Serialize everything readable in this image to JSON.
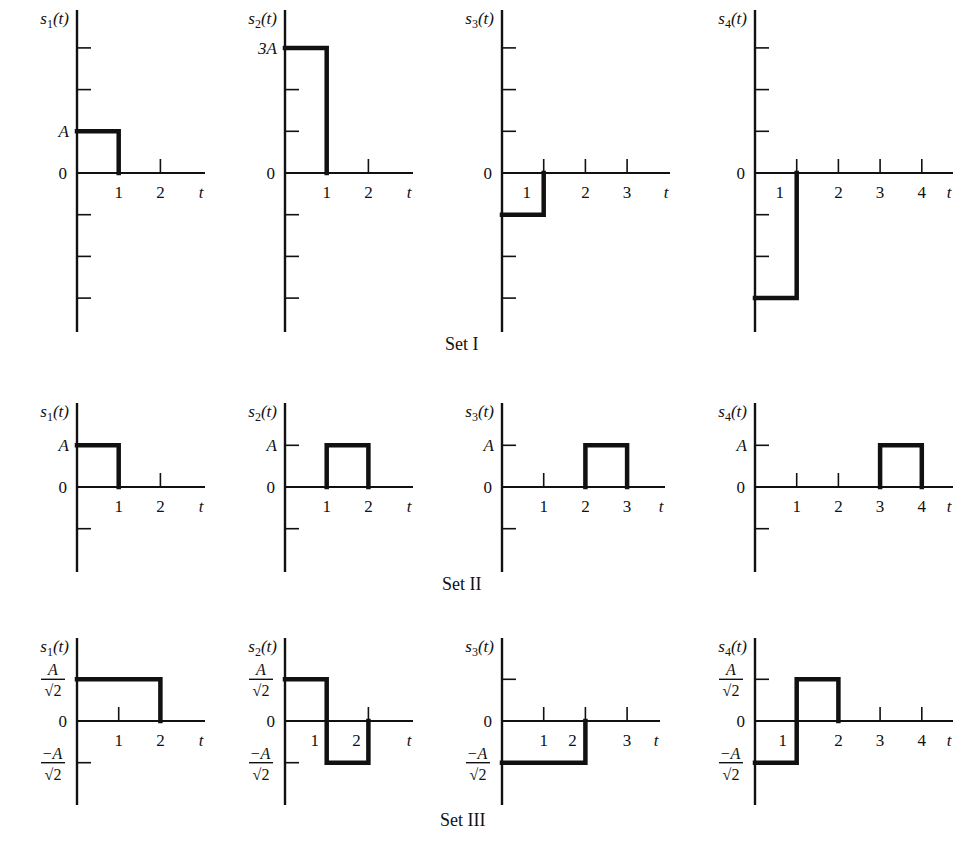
{
  "figure": {
    "ink_color": "#111111",
    "background": "#ffffff",
    "unit_px": 41.7,
    "sets": [
      {
        "label": "Set I",
        "label_pos": [
          445,
          350
        ],
        "axis_top": 10,
        "axis_bottom": 332,
        "zero_y": 173,
        "y_ticks_units": [
          3,
          2,
          1,
          -1,
          -2,
          -3
        ],
        "plots": [
          {
            "name": "s1(t)",
            "sub": "1",
            "axis_x": 77,
            "x_end": 205,
            "x_ticks": [
              1,
              2
            ],
            "x_tick_labels": [
              {
                "t": 1,
                "text": "1",
                "dx": 0
              },
              {
                "t": 2,
                "text": "2",
                "dx": 0
              }
            ],
            "y_labels": [
              {
                "v": 1,
                "text": "A"
              }
            ],
            "show_tick_marks": [
              false,
              true
            ],
            "segments": [
              [
                0,
                1
              ],
              [
                1,
                1
              ],
              [
                1,
                0
              ]
            ]
          },
          {
            "name": "s2(t)",
            "sub": "2",
            "axis_x": 285,
            "x_end": 413,
            "x_ticks": [
              1,
              2
            ],
            "x_tick_labels": [
              {
                "t": 1,
                "text": "1",
                "dx": 0
              },
              {
                "t": 2,
                "text": "2",
                "dx": 0
              }
            ],
            "y_labels": [
              {
                "v": 3,
                "text": "3A"
              }
            ],
            "show_tick_marks": [
              false,
              true
            ],
            "segments": [
              [
                0,
                3
              ],
              [
                1,
                3
              ],
              [
                1,
                0
              ]
            ]
          },
          {
            "name": "s3(t)",
            "sub": "3",
            "axis_x": 502,
            "x_end": 670,
            "x_ticks": [
              1,
              2,
              3
            ],
            "x_tick_labels": [
              {
                "t": 1,
                "text": "1",
                "dx": -17
              },
              {
                "t": 2,
                "text": "2",
                "dx": 0
              },
              {
                "t": 3,
                "text": "3",
                "dx": 0
              }
            ],
            "y_labels": [],
            "show_tick_marks": [
              true,
              true,
              true
            ],
            "segments": [
              [
                0,
                -1
              ],
              [
                1,
                -1
              ],
              [
                1,
                0
              ]
            ]
          },
          {
            "name": "s4(t)",
            "sub": "4",
            "axis_x": 755,
            "x_end": 953,
            "x_ticks": [
              1,
              2,
              3,
              4
            ],
            "x_tick_labels": [
              {
                "t": 1,
                "text": "1",
                "dx": -17
              },
              {
                "t": 2,
                "text": "2",
                "dx": 0
              },
              {
                "t": 3,
                "text": "3",
                "dx": 0
              },
              {
                "t": 4,
                "text": "4",
                "dx": 0
              }
            ],
            "y_labels": [],
            "show_tick_marks": [
              true,
              true,
              true,
              true
            ],
            "segments": [
              [
                0,
                -3
              ],
              [
                1,
                -3
              ],
              [
                1,
                0
              ]
            ]
          }
        ]
      },
      {
        "label": "Set II",
        "label_pos": [
          442,
          590
        ],
        "axis_top": 403,
        "axis_bottom": 572,
        "zero_y": 487,
        "y_ticks_units": [
          1,
          -1
        ],
        "plots": [
          {
            "name": "s1(t)",
            "sub": "1",
            "axis_x": 77,
            "x_end": 205,
            "x_ticks": [
              1,
              2
            ],
            "x_tick_labels": [
              {
                "t": 1,
                "text": "1",
                "dx": 0
              },
              {
                "t": 2,
                "text": "2",
                "dx": 0
              }
            ],
            "y_labels": [
              {
                "v": 1,
                "text": "A"
              }
            ],
            "show_tick_marks": [
              false,
              true
            ],
            "segments": [
              [
                0,
                1
              ],
              [
                1,
                1
              ],
              [
                1,
                0
              ]
            ]
          },
          {
            "name": "s2(t)",
            "sub": "2",
            "axis_x": 285,
            "x_end": 413,
            "x_ticks": [
              1,
              2
            ],
            "x_tick_labels": [
              {
                "t": 1,
                "text": "1",
                "dx": 0
              },
              {
                "t": 2,
                "text": "2",
                "dx": 0
              }
            ],
            "y_labels": [
              {
                "v": 1,
                "text": "A"
              }
            ],
            "show_tick_marks": [
              false,
              false
            ],
            "segments": [
              [
                1,
                0
              ],
              [
                1,
                1
              ],
              [
                2,
                1
              ],
              [
                2,
                0
              ]
            ]
          },
          {
            "name": "s3(t)",
            "sub": "3",
            "axis_x": 502,
            "x_end": 665,
            "x_ticks": [
              1,
              2,
              3
            ],
            "x_tick_labels": [
              {
                "t": 1,
                "text": "1",
                "dx": 0
              },
              {
                "t": 2,
                "text": "2",
                "dx": 0
              },
              {
                "t": 3,
                "text": "3",
                "dx": 0
              }
            ],
            "y_labels": [
              {
                "v": 1,
                "text": "A"
              }
            ],
            "show_tick_marks": [
              true,
              false,
              false
            ],
            "segments": [
              [
                2,
                0
              ],
              [
                2,
                1
              ],
              [
                3,
                1
              ],
              [
                3,
                0
              ]
            ]
          },
          {
            "name": "s4(t)",
            "sub": "4",
            "axis_x": 755,
            "x_end": 953,
            "x_ticks": [
              1,
              2,
              3,
              4
            ],
            "x_tick_labels": [
              {
                "t": 1,
                "text": "1",
                "dx": 0
              },
              {
                "t": 2,
                "text": "2",
                "dx": 0
              },
              {
                "t": 3,
                "text": "3",
                "dx": 0
              },
              {
                "t": 4,
                "text": "4",
                "dx": 0
              }
            ],
            "y_labels": [
              {
                "v": 1,
                "text": "A"
              }
            ],
            "show_tick_marks": [
              true,
              true,
              false,
              false
            ],
            "segments": [
              [
                3,
                0
              ],
              [
                3,
                1
              ],
              [
                4,
                1
              ],
              [
                4,
                0
              ]
            ]
          }
        ]
      },
      {
        "label": "Set III",
        "label_pos": [
          440,
          826
        ],
        "axis_top": 638,
        "axis_bottom": 805,
        "zero_y": 721,
        "y_ticks_units": [
          1,
          -1
        ],
        "plots": [
          {
            "name": "s1(t)",
            "sub": "1",
            "axis_x": 77,
            "x_end": 205,
            "x_ticks": [
              1,
              2
            ],
            "x_tick_labels": [
              {
                "t": 1,
                "text": "1",
                "dx": 0
              },
              {
                "t": 2,
                "text": "2",
                "dx": 0
              }
            ],
            "y_labels": [
              {
                "v": 1,
                "text": "A/√2"
              },
              {
                "v": -1,
                "text": "−A/√2"
              }
            ],
            "show_tick_marks": [
              true,
              false
            ],
            "segments": [
              [
                0,
                1
              ],
              [
                2,
                1
              ],
              [
                2,
                0
              ]
            ]
          },
          {
            "name": "s2(t)",
            "sub": "2",
            "axis_x": 285,
            "x_end": 413,
            "x_ticks": [
              1,
              2
            ],
            "x_tick_labels": [
              {
                "t": 1,
                "text": "1",
                "dx": -12
              },
              {
                "t": 2,
                "text": "2",
                "dx": -12
              }
            ],
            "y_labels": [
              {
                "v": 1,
                "text": "A/√2"
              },
              {
                "v": -1,
                "text": "−A/√2"
              }
            ],
            "show_tick_marks": [
              false,
              true
            ],
            "segments": [
              [
                0,
                1
              ],
              [
                1,
                1
              ],
              [
                1,
                -1
              ],
              [
                2,
                -1
              ],
              [
                2,
                0
              ]
            ]
          },
          {
            "name": "s3(t)",
            "sub": "3",
            "axis_x": 502,
            "x_end": 660,
            "x_ticks": [
              1,
              2,
              3
            ],
            "x_tick_labels": [
              {
                "t": 1,
                "text": "1",
                "dx": 0
              },
              {
                "t": 2,
                "text": "2",
                "dx": -13
              },
              {
                "t": 3,
                "text": "3",
                "dx": 0
              }
            ],
            "y_labels": [
              {
                "v": -1,
                "text": "−A/√2"
              }
            ],
            "show_tick_marks": [
              true,
              true,
              true
            ],
            "segments": [
              [
                0,
                -1
              ],
              [
                2,
                -1
              ],
              [
                2,
                0
              ]
            ]
          },
          {
            "name": "s4(t)",
            "sub": "4",
            "axis_x": 755,
            "x_end": 953,
            "x_ticks": [
              1,
              2,
              3,
              4
            ],
            "x_tick_labels": [
              {
                "t": 1,
                "text": "1",
                "dx": -14
              },
              {
                "t": 2,
                "text": "2",
                "dx": 0
              },
              {
                "t": 3,
                "text": "3",
                "dx": 0
              },
              {
                "t": 4,
                "text": "4",
                "dx": 0
              }
            ],
            "y_labels": [
              {
                "v": 1,
                "text": "A/√2"
              },
              {
                "v": -1,
                "text": "−A/√2"
              }
            ],
            "show_tick_marks": [
              false,
              false,
              true,
              true
            ],
            "segments": [
              [
                0,
                -1
              ],
              [
                1,
                -1
              ],
              [
                1,
                1
              ],
              [
                2,
                1
              ],
              [
                2,
                0
              ]
            ]
          }
        ]
      }
    ]
  },
  "chart_data": {
    "type": "line",
    "xlabel": "t",
    "ylabel": "s_i(t)",
    "series": [
      {
        "name": "Set I s1(t)",
        "x": [
          0,
          1,
          1
        ],
        "y": [
          "A",
          "A",
          "0"
        ]
      },
      {
        "name": "Set I s2(t)",
        "x": [
          0,
          1,
          1
        ],
        "y": [
          "3A",
          "3A",
          "0"
        ]
      },
      {
        "name": "Set I s3(t)",
        "x": [
          0,
          1,
          1
        ],
        "y": [
          "-A",
          "-A",
          "0"
        ]
      },
      {
        "name": "Set I s4(t)",
        "x": [
          0,
          1,
          1
        ],
        "y": [
          "-3A",
          "-3A",
          "0"
        ]
      },
      {
        "name": "Set II s1(t)",
        "x": [
          0,
          1,
          1
        ],
        "y": [
          "A",
          "A",
          "0"
        ]
      },
      {
        "name": "Set II s2(t)",
        "x": [
          1,
          1,
          2,
          2
        ],
        "y": [
          "0",
          "A",
          "A",
          "0"
        ]
      },
      {
        "name": "Set II s3(t)",
        "x": [
          2,
          2,
          3,
          3
        ],
        "y": [
          "0",
          "A",
          "A",
          "0"
        ]
      },
      {
        "name": "Set II s4(t)",
        "x": [
          3,
          3,
          4,
          4
        ],
        "y": [
          "0",
          "A",
          "A",
          "0"
        ]
      },
      {
        "name": "Set III s1(t)",
        "x": [
          0,
          2,
          2
        ],
        "y": [
          "A/√2",
          "A/√2",
          "0"
        ]
      },
      {
        "name": "Set III s2(t)",
        "x": [
          0,
          1,
          1,
          2,
          2
        ],
        "y": [
          "A/√2",
          "A/√2",
          "-A/√2",
          "-A/√2",
          "0"
        ]
      },
      {
        "name": "Set III s3(t)",
        "x": [
          0,
          2,
          2
        ],
        "y": [
          "-A/√2",
          "-A/√2",
          "0"
        ]
      },
      {
        "name": "Set III s4(t)",
        "x": [
          0,
          1,
          1,
          2,
          2
        ],
        "y": [
          "-A/√2",
          "-A/√2",
          "A/√2",
          "A/√2",
          "0"
        ]
      }
    ],
    "set_labels": [
      "Set I",
      "Set II",
      "Set III"
    ],
    "x_axis_label": "t",
    "zero_label": "0"
  },
  "labels": {
    "axis_t": "t",
    "zero": "0"
  }
}
